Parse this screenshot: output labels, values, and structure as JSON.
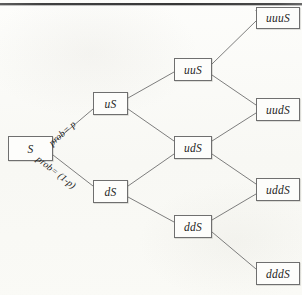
{
  "figure": {
    "type": "binomial-tree-diagram",
    "steps": 3,
    "background_color": "#fbfbf8",
    "line_color": "#6f6f6f",
    "top_rule_color": "#3b3b3b"
  },
  "nodes": [
    {
      "id": "root",
      "label": "S",
      "x": 8,
      "y": 136,
      "w": 45,
      "h": 25,
      "column": 0
    },
    {
      "id": "u",
      "label": "uS",
      "x": 93,
      "y": 92,
      "w": 35,
      "h": 23,
      "column": 1
    },
    {
      "id": "d",
      "label": "dS",
      "x": 93,
      "y": 180,
      "w": 35,
      "h": 23,
      "column": 1
    },
    {
      "id": "uu",
      "label": "uuS",
      "x": 174,
      "y": 58,
      "w": 38,
      "h": 23,
      "column": 2
    },
    {
      "id": "ud",
      "label": "udS",
      "x": 174,
      "y": 136,
      "w": 38,
      "h": 23,
      "column": 2
    },
    {
      "id": "dd",
      "label": "ddS",
      "x": 174,
      "y": 215,
      "w": 38,
      "h": 23,
      "column": 2
    },
    {
      "id": "uuu",
      "label": "uuuS",
      "x": 256,
      "y": 7,
      "w": 44,
      "h": 22,
      "column": 3
    },
    {
      "id": "uud",
      "label": "uudS",
      "x": 256,
      "y": 98,
      "w": 44,
      "h": 23,
      "column": 3
    },
    {
      "id": "udd",
      "label": "uddS",
      "x": 256,
      "y": 178,
      "w": 44,
      "h": 23,
      "column": 3
    },
    {
      "id": "ddd",
      "label": "dddS",
      "x": 256,
      "y": 262,
      "w": 44,
      "h": 23,
      "column": 3
    }
  ],
  "edges": [
    {
      "from": "root",
      "to": "u",
      "x1": 53,
      "y1": 143,
      "x2": 93,
      "y2": 109,
      "label": "prob= p"
    },
    {
      "from": "root",
      "to": "d",
      "x1": 53,
      "y1": 155,
      "x2": 93,
      "y2": 186,
      "label": "prob= (1-p)"
    },
    {
      "from": "u",
      "to": "uu",
      "x1": 128,
      "y1": 98,
      "x2": 174,
      "y2": 72,
      "label": ""
    },
    {
      "from": "u",
      "to": "ud",
      "x1": 128,
      "y1": 109,
      "x2": 174,
      "y2": 141,
      "label": ""
    },
    {
      "from": "d",
      "to": "ud",
      "x1": 128,
      "y1": 186,
      "x2": 174,
      "y2": 154,
      "label": ""
    },
    {
      "from": "d",
      "to": "dd",
      "x1": 128,
      "y1": 197,
      "x2": 174,
      "y2": 222,
      "label": ""
    },
    {
      "from": "uu",
      "to": "uuu",
      "x1": 212,
      "y1": 64,
      "x2": 256,
      "y2": 21,
      "label": ""
    },
    {
      "from": "uu",
      "to": "uud",
      "x1": 212,
      "y1": 75,
      "x2": 256,
      "y2": 105,
      "label": ""
    },
    {
      "from": "ud",
      "to": "uud",
      "x1": 212,
      "y1": 141,
      "x2": 256,
      "y2": 113,
      "label": ""
    },
    {
      "from": "ud",
      "to": "udd",
      "x1": 212,
      "y1": 154,
      "x2": 256,
      "y2": 184,
      "label": ""
    },
    {
      "from": "dd",
      "to": "udd",
      "x1": 212,
      "y1": 220,
      "x2": 256,
      "y2": 194,
      "label": ""
    },
    {
      "from": "dd",
      "to": "ddd",
      "x1": 212,
      "y1": 232,
      "x2": 256,
      "y2": 269,
      "label": ""
    }
  ],
  "edge_labels": {
    "up": "prob= p",
    "down": "prob= (1-p)"
  }
}
